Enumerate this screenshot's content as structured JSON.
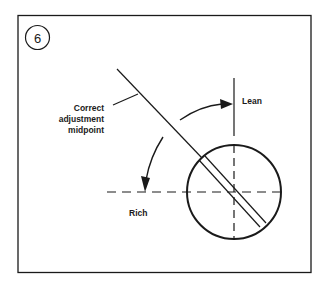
{
  "figure": {
    "step_number": "6",
    "labels": {
      "callout_line1": "Correct",
      "callout_line2": "adjustment",
      "callout_line3": "midpoint",
      "lean": "Lean",
      "rich": "Rich"
    },
    "colors": {
      "ink": "#1a1a1a",
      "background": "#ffffff"
    }
  }
}
